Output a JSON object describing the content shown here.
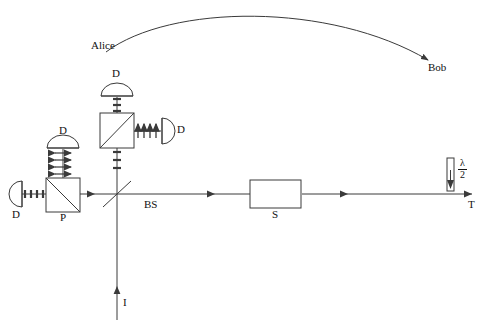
{
  "figure": {
    "type": "optics-setup-diagram",
    "background": "#ffffff",
    "stroke_color": "#3a3a3a",
    "text_color": "#111111",
    "width": 483,
    "height": 326
  },
  "labels": {
    "alice": "Alice",
    "bob": "Bob",
    "detector_left": "D",
    "detector_upper_left": "D",
    "detector_top": "D",
    "detector_right": "D",
    "polarizer": "P",
    "beamsplitter": "BS",
    "source": "S",
    "transmitted": "T",
    "input": "I",
    "waveplate_numerator": "λ",
    "waveplate_denominator": "2"
  },
  "components": [
    {
      "name": "polarizing-beamsplitter-p",
      "label": "P",
      "x": 46,
      "y": 178,
      "w": 34,
      "h": 34,
      "diagonal": "tl-br"
    },
    {
      "name": "polarizing-beamsplitter-upper",
      "label": "",
      "x": 100,
      "y": 113,
      "w": 34,
      "h": 35,
      "diagonal": "bl-tr"
    },
    {
      "name": "beamsplitter-bs",
      "label": "BS",
      "x": 110,
      "y": 195,
      "type": "diagonal-line"
    },
    {
      "name": "source-box-s",
      "label": "S",
      "x": 250,
      "y": 180,
      "w": 51,
      "h": 28
    },
    {
      "name": "half-wave-plate",
      "label": "λ/2",
      "x": 447,
      "y": 158,
      "w": 7,
      "h": 33
    }
  ],
  "detectors": [
    {
      "name": "detector-left",
      "label": "D",
      "orientation": "facing-right",
      "cx": 13,
      "cy": 194
    },
    {
      "name": "detector-upper-left",
      "label": "D",
      "orientation": "facing-down",
      "cx": 63,
      "cy": 140
    },
    {
      "name": "detector-top",
      "label": "D",
      "orientation": "facing-down",
      "cx": 117,
      "cy": 92
    },
    {
      "name": "detector-right",
      "label": "D",
      "orientation": "facing-left",
      "cx": 170,
      "cy": 131
    }
  ],
  "polarization_marks": [
    {
      "name": "vertical-ticks-left-arm",
      "symbol": "vertical-dash",
      "count": 4,
      "axis": "horizontal",
      "y": 194,
      "from_x": 22,
      "to_x": 45
    },
    {
      "name": "horizontal-arrows-upper-left-arm",
      "symbol": "double-arrow-horizontal",
      "count": 4,
      "axis": "vertical",
      "x": 63,
      "from_y": 152,
      "to_y": 178
    },
    {
      "name": "horizontal-dashes-top-arm",
      "symbol": "horizontal-dash",
      "count": 4,
      "axis": "vertical",
      "x": 117,
      "from_y": 96,
      "to_y": 112
    },
    {
      "name": "up-arrows-right-arm",
      "symbol": "up-arrow",
      "count": 4,
      "axis": "horizontal",
      "y": 131,
      "from_x": 138,
      "to_x": 160
    },
    {
      "name": "up-dashes-lower-vertical",
      "symbol": "horizontal-dash",
      "count": 3,
      "axis": "vertical",
      "x": 117,
      "from_y": 150,
      "to_y": 170
    }
  ],
  "beam_paths": [
    {
      "name": "main-horizontal-beam",
      "from": [
        22,
        194
      ],
      "to": [
        472,
        194
      ],
      "direction": "leftward"
    },
    {
      "name": "input-vertical-beam",
      "from": [
        117,
        320
      ],
      "to": [
        117,
        194
      ],
      "direction": "upward"
    },
    {
      "name": "upper-vertical-beam",
      "from": [
        117,
        194
      ],
      "to": [
        117,
        96
      ],
      "direction": "upward"
    },
    {
      "name": "upper-left-vertical-beam",
      "from": [
        63,
        178
      ],
      "to": [
        63,
        148
      ],
      "direction": "upward"
    },
    {
      "name": "pbs-to-right-detector",
      "from": [
        134,
        131
      ],
      "to": [
        162,
        131
      ],
      "direction": "rightward"
    }
  ],
  "classical_channel": {
    "name": "alice-to-bob-arc",
    "from_label": "Alice",
    "to_label": "Bob",
    "arrow_at": "Bob"
  }
}
